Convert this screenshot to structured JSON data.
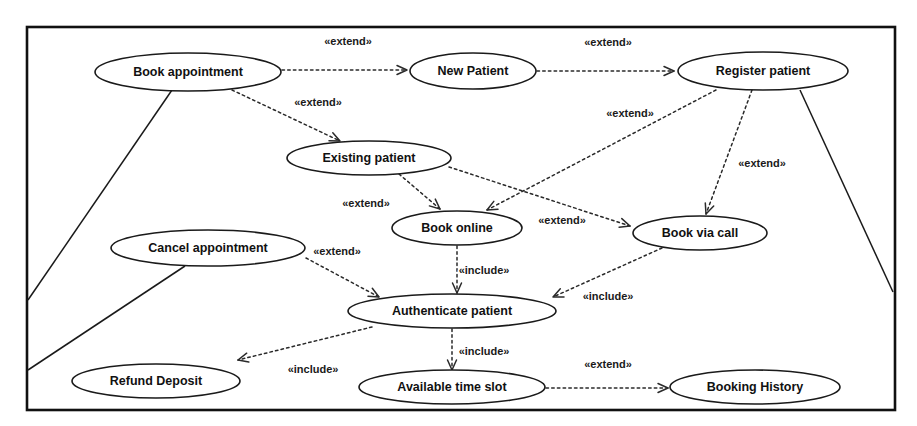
{
  "diagram": {
    "type": "uml-use-case-diagram",
    "title": "",
    "boundary": {
      "x": 27,
      "y": 27,
      "width": 868,
      "height": 383
    },
    "colors": {
      "background": "#fefefe",
      "node_fill": "#ffffff",
      "node_stroke": "#1a1a1a",
      "text": "#111111",
      "relation_stroke": "#2a2a2a",
      "boundary_stroke": "#111111"
    },
    "use_cases": [
      {
        "id": "book_appointment",
        "label": "Book appointment",
        "cx": 188,
        "cy": 72,
        "rx": 93,
        "ry": 19
      },
      {
        "id": "new_patient",
        "label": "New Patient",
        "cx": 473,
        "cy": 71,
        "rx": 63,
        "ry": 18
      },
      {
        "id": "register_patient",
        "label": "Register patient",
        "cx": 763,
        "cy": 71,
        "rx": 85,
        "ry": 19
      },
      {
        "id": "existing_patient",
        "label": "Existing patient",
        "cx": 369,
        "cy": 158,
        "rx": 82,
        "ry": 17
      },
      {
        "id": "book_online",
        "label": "Book online",
        "cx": 457,
        "cy": 228,
        "rx": 65,
        "ry": 17
      },
      {
        "id": "book_via_call",
        "label": "Book via call",
        "cx": 700,
        "cy": 233,
        "rx": 67,
        "ry": 17
      },
      {
        "id": "cancel_appointment",
        "label": "Cancel appointment",
        "cx": 208,
        "cy": 248,
        "rx": 97,
        "ry": 18
      },
      {
        "id": "authenticate_patient",
        "label": "Authenticate patient",
        "cx": 452,
        "cy": 311,
        "rx": 104,
        "ry": 17
      },
      {
        "id": "refund_deposit",
        "label": "Refund Deposit",
        "cx": 156,
        "cy": 381,
        "rx": 84,
        "ry": 17
      },
      {
        "id": "available_time_slot",
        "label": "Available time slot",
        "cx": 452,
        "cy": 387,
        "rx": 93,
        "ry": 17
      },
      {
        "id": "booking_history",
        "label": "Booking History",
        "cx": 755,
        "cy": 387,
        "rx": 85,
        "ry": 17
      }
    ],
    "relationships": [
      {
        "id": "rel_book_to_new",
        "from": "book_appointment",
        "to": "new_patient",
        "stereotype": "«extend»",
        "label_x": 348,
        "label_y": 42,
        "x1": 282,
        "y1": 70,
        "x2": 407,
        "y2": 70
      },
      {
        "id": "rel_new_to_register",
        "from": "new_patient",
        "to": "register_patient",
        "stereotype": "«extend»",
        "label_x": 608,
        "label_y": 43,
        "x1": 537,
        "y1": 71,
        "x2": 674,
        "y2": 71
      },
      {
        "id": "rel_book_to_existing",
        "from": "book_appointment",
        "to": "existing_patient",
        "stereotype": "«extend»",
        "label_x": 318,
        "label_y": 103,
        "x1": 232,
        "y1": 90,
        "x2": 340,
        "y2": 141
      },
      {
        "id": "rel_existing_to_online",
        "from": "existing_patient",
        "to": "book_online",
        "stereotype": "«extend»",
        "label_x": 366,
        "label_y": 204,
        "x1": 399,
        "y1": 174,
        "x2": 440,
        "y2": 209
      },
      {
        "id": "rel_register_to_online",
        "from": "register_patient",
        "to": "book_online",
        "stereotype": "«extend»",
        "label_x": 630,
        "label_y": 114,
        "x1": 716,
        "y1": 90,
        "x2": 487,
        "y2": 210
      },
      {
        "id": "rel_register_to_call",
        "from": "register_patient",
        "to": "book_via_call",
        "stereotype": "«extend»",
        "label_x": 762,
        "label_y": 164,
        "x1": 752,
        "y1": 90,
        "x2": 706,
        "y2": 214
      },
      {
        "id": "rel_existing_to_call",
        "from": "existing_patient",
        "to": "book_via_call",
        "stereotype": "«extend»",
        "label_x": 562,
        "label_y": 221,
        "x1": 449,
        "y1": 167,
        "x2": 630,
        "y2": 226
      },
      {
        "id": "rel_cancel_to_auth",
        "from": "cancel_appointment",
        "to": "authenticate_patient",
        "stereotype": "«extend»",
        "label_x": 337,
        "label_y": 252,
        "x1": 306,
        "y1": 258,
        "x2": 379,
        "y2": 297
      },
      {
        "id": "rel_online_to_auth",
        "from": "book_online",
        "to": "authenticate_patient",
        "stereotype": "«include»",
        "label_x": 484,
        "label_y": 271,
        "x1": 457,
        "y1": 246,
        "x2": 457,
        "y2": 293
      },
      {
        "id": "rel_call_to_auth",
        "from": "book_via_call",
        "to": "authenticate_patient",
        "stereotype": "«include»",
        "label_x": 608,
        "label_y": 297,
        "x1": 662,
        "y1": 248,
        "x2": 553,
        "y2": 297
      },
      {
        "id": "rel_auth_to_refund",
        "from": "authenticate_patient",
        "to": "refund_deposit",
        "stereotype": "«include»",
        "label_x": 313,
        "label_y": 370,
        "x1": 372,
        "y1": 327,
        "x2": 238,
        "y2": 360
      },
      {
        "id": "rel_auth_to_slot",
        "from": "authenticate_patient",
        "to": "available_time_slot",
        "stereotype": "«include»",
        "label_x": 484,
        "label_y": 352,
        "x1": 452,
        "y1": 329,
        "x2": 452,
        "y2": 370
      },
      {
        "id": "rel_slot_to_history",
        "from": "available_time_slot",
        "to": "booking_history",
        "stereotype": "«extend»",
        "label_x": 608,
        "label_y": 365,
        "x1": 546,
        "y1": 388,
        "x2": 668,
        "y2": 388
      }
    ],
    "associations": [
      {
        "id": "assoc_book_appointment_actor",
        "from": "book_appointment",
        "x1": 172,
        "y1": 90,
        "x2": 28,
        "y2": 300
      },
      {
        "id": "assoc_cancel_actor",
        "from": "cancel_appointment",
        "x1": 185,
        "y1": 266,
        "x2": 28,
        "y2": 370
      },
      {
        "id": "assoc_register_actor",
        "from": "register_patient",
        "x1": 800,
        "y1": 90,
        "x2": 893,
        "y2": 292
      }
    ],
    "stereotype_extend": "«extend»",
    "stereotype_include": "«include»"
  }
}
